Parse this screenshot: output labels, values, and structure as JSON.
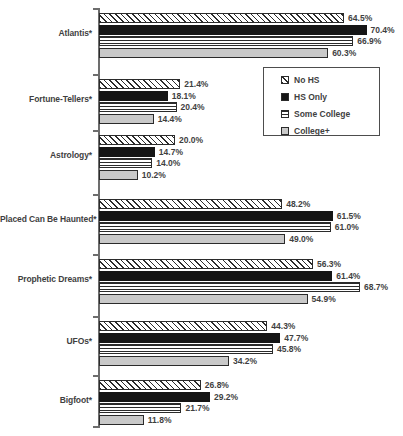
{
  "chart_data": {
    "type": "bar",
    "orientation": "horizontal",
    "title": "",
    "subtitle": "",
    "xlabel": "",
    "ylabel": "",
    "xlim": [
      0,
      72
    ],
    "grid": false,
    "legend_position": "upper-right-inside",
    "value_suffix": "%",
    "categories": [
      "Atlantis*",
      "Fortune-Tellers*",
      "Astrology*",
      "Placed Can Be Haunted*",
      "Prophetic Dreams*",
      "UFOs*",
      "Bigfoot*"
    ],
    "series": [
      {
        "name": "No HS",
        "pattern": "diagonal-hatch",
        "values": [
          64.5,
          21.4,
          20.0,
          48.2,
          56.3,
          44.3,
          26.8
        ],
        "labels": [
          "64.5%",
          "21.4%",
          "20.0%",
          "48.2%",
          "56.3%",
          "44.3%",
          "26.8%"
        ]
      },
      {
        "name": "HS Only",
        "pattern": "solid-black",
        "values": [
          70.4,
          18.1,
          14.7,
          61.5,
          61.4,
          47.7,
          29.2
        ],
        "labels": [
          "70.4%",
          "18.1%",
          "14.7%",
          "61.5%",
          "61.4%",
          "47.7%",
          "29.2%"
        ]
      },
      {
        "name": "Some College",
        "pattern": "horizontal-lines",
        "values": [
          66.9,
          20.4,
          14.0,
          61.0,
          68.7,
          45.8,
          21.7
        ],
        "labels": [
          "66.9%",
          "20.4%",
          "14.0%",
          "61.0%",
          "68.7%",
          "45.8%",
          "21.7%"
        ]
      },
      {
        "name": "College+",
        "pattern": "solid-gray",
        "values": [
          60.3,
          14.4,
          10.2,
          49.0,
          54.9,
          34.2,
          11.8
        ],
        "labels": [
          "60.3%",
          "14.4%",
          "10.2%",
          "49.0%",
          "54.9%",
          "34.2%",
          "11.8%"
        ]
      }
    ]
  },
  "legend": {
    "items": [
      {
        "label": "No HS"
      },
      {
        "label": "HS Only"
      },
      {
        "label": "Some College"
      },
      {
        "label": "College+"
      }
    ]
  }
}
